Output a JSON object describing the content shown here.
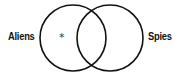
{
  "diagram": {
    "type": "venn",
    "sets": [
      {
        "label": "Aliens",
        "cx": 73,
        "cy": 38,
        "r": 33
      },
      {
        "label": "Spies",
        "cx": 110,
        "cy": 38,
        "r": 33
      }
    ],
    "marker": {
      "symbol": "*",
      "region": "Aliens only",
      "x": 62,
      "y": 38
    },
    "stroke_color": "#111111"
  }
}
